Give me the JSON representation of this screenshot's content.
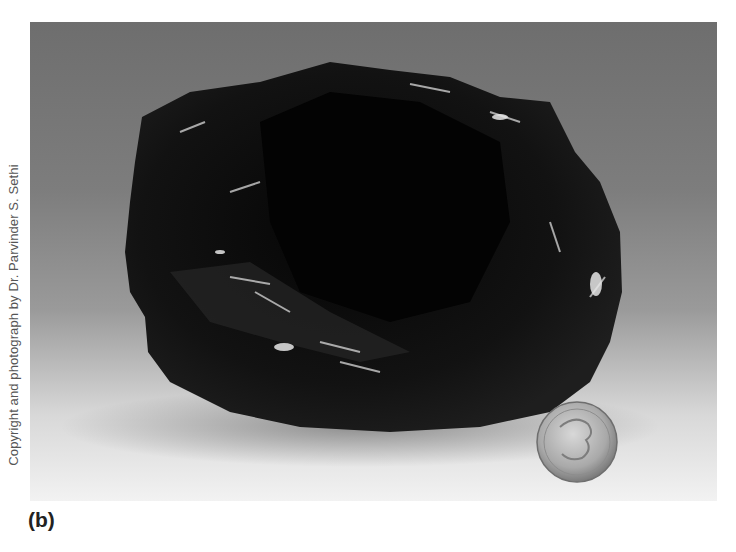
{
  "figure": {
    "panel_label": "(b)",
    "credit": "Copyright and photograph by Dr. Parvinder S. Sethi",
    "scale_reference": "coin",
    "background_colors": {
      "top": "#6e6e6e",
      "bottom": "#f2f2f2"
    },
    "rock_color": "#0b0b0b",
    "highlight_color": "#d9d9d9"
  }
}
